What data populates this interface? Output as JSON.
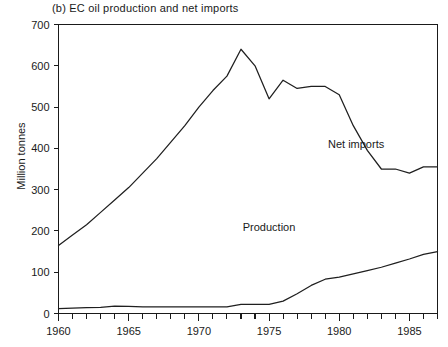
{
  "chart_data": {
    "type": "line",
    "title": "(b)  EC oil production and net imports",
    "xlabel": "",
    "ylabel": "Million tonnes",
    "xlim": [
      1960,
      1987
    ],
    "ylim": [
      0,
      700
    ],
    "ytick_step": 100,
    "yticks": [
      0,
      100,
      200,
      300,
      400,
      500,
      600,
      700
    ],
    "ytick_labels": [
      "0",
      "100",
      "200",
      "300",
      "400",
      "500",
      "600",
      "700"
    ],
    "xticks": [
      1960,
      1965,
      1970,
      1975,
      1980,
      1985
    ],
    "xtick_labels": [
      "1960",
      "1965",
      "1970",
      "1975",
      "1980",
      "1985"
    ],
    "xtick_minor_step": 1,
    "grid": false,
    "legend_position": "inline-annotation",
    "line_color": "#1f1f1f",
    "x": [
      1960,
      1961,
      1962,
      1963,
      1964,
      1965,
      1966,
      1967,
      1968,
      1969,
      1970,
      1971,
      1972,
      1973,
      1974,
      1975,
      1976,
      1977,
      1978,
      1979,
      1980,
      1981,
      1982,
      1983,
      1984,
      1985,
      1986,
      1987
    ],
    "series": [
      {
        "name": "Net imports",
        "label": "Net imports",
        "values": [
          165,
          190,
          215,
          245,
          275,
          305,
          340,
          375,
          415,
          455,
          500,
          540,
          575,
          640,
          600,
          520,
          565,
          545,
          550,
          550,
          530,
          455,
          395,
          350,
          350,
          340,
          355,
          355
        ]
      },
      {
        "name": "Production",
        "label": "Production",
        "values": [
          12,
          13,
          14,
          15,
          18,
          17,
          16,
          16,
          16,
          16,
          16,
          16,
          16,
          22,
          22,
          22,
          30,
          48,
          68,
          83,
          88,
          96,
          104,
          112,
          122,
          132,
          143,
          150
        ]
      }
    ],
    "annotations": [
      {
        "text": "Net imports",
        "x": 1981.2,
        "y": 400
      },
      {
        "text": "Production",
        "x": 1975.0,
        "y": 200
      }
    ]
  }
}
